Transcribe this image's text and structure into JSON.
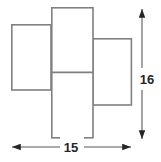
{
  "figure": {
    "kind": "geometry-diagram",
    "background_color": "#ffffff",
    "stroke_color": "#808080",
    "stroke_width": 1.6,
    "text_color": "#262626",
    "shapes": [
      {
        "name": "left-rectangle",
        "x": 11,
        "y": 24,
        "width": 40,
        "height": 66
      },
      {
        "name": "middle-rectangle",
        "x": 51,
        "y": 7,
        "width": 42,
        "height": 131
      },
      {
        "name": "right-rectangle",
        "x": 93,
        "y": 38,
        "width": 39,
        "height": 67
      }
    ],
    "divider_lines": [
      {
        "name": "middle-rectangle-divider",
        "x1": 51,
        "y1": 72,
        "x2": 93,
        "y2": 72
      }
    ],
    "dimensions": [
      {
        "name": "width-dimension",
        "orientation": "horizontal",
        "label": "15",
        "label_x": 71,
        "label_y": 152,
        "line": {
          "x1": 11,
          "y1": 147,
          "x2": 132,
          "y2": 147
        },
        "arrows": [
          "start",
          "end"
        ]
      },
      {
        "name": "height-dimension",
        "orientation": "vertical",
        "label": "16",
        "label_x": 148,
        "label_y": 79,
        "line": {
          "x1": 142,
          "y1": 8,
          "x2": 142,
          "y2": 140
        },
        "arrows": [
          "start",
          "end"
        ]
      }
    ]
  }
}
